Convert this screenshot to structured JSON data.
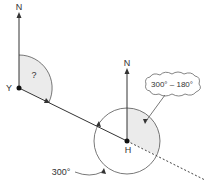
{
  "diagram": {
    "north_label_y": "N",
    "north_label_h": "N",
    "point_y_label": "Y",
    "point_h_label": "H",
    "unknown_angle_label": "?",
    "angle_label_h": "300°",
    "cloud_label": "300° – 180°"
  },
  "colors": {
    "line": "#333333",
    "shade": "#ebebeb",
    "text": "#333333"
  }
}
